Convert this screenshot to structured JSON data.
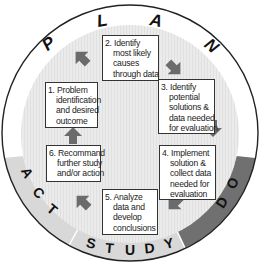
{
  "figure": {
    "type": "PDSA cycle diagram",
    "colors": {
      "outline": "#222222",
      "plan_segment": "#ffffff",
      "do_segment": "#6e6e6e",
      "study_segment": "#d9d9d9",
      "act_segment": "#d9d9d9",
      "inner_disk": "#e9e9e9",
      "arrow": "#6b6b6b",
      "box_fill": "#ffffff",
      "box_border": "#333333"
    },
    "segments": [
      {
        "id": "plan",
        "letters": [
          "P",
          "L",
          "A",
          "N"
        ]
      },
      {
        "id": "do",
        "letters": [
          "D",
          "O"
        ]
      },
      {
        "id": "study",
        "letters": [
          "S",
          "T",
          "U",
          "D",
          "Y"
        ]
      },
      {
        "id": "act",
        "letters": [
          "A",
          "C",
          "T"
        ]
      }
    ],
    "steps": [
      {
        "number": "1.",
        "lines": [
          "Problem",
          "identification",
          "and desired",
          "outcome"
        ]
      },
      {
        "number": "2.",
        "lines": [
          "Identify",
          "most likely",
          "causes",
          "through data"
        ]
      },
      {
        "number": "3.",
        "lines": [
          "Identify",
          "potential",
          "solutions &",
          "data needed",
          "for evaluation"
        ]
      },
      {
        "number": "4.",
        "lines": [
          "Implement",
          "solution &",
          "collect data",
          "needed for",
          "evaluation"
        ]
      },
      {
        "number": "5.",
        "lines": [
          "Analyze",
          "data and",
          "develop",
          "conclusions"
        ]
      },
      {
        "number": "6.",
        "lines": [
          "Recommand",
          "further study",
          "and/or action"
        ]
      }
    ],
    "arrows": [
      {
        "from": "1",
        "to": "2",
        "direction": "up-right"
      },
      {
        "from": "2",
        "to": "3",
        "direction": "down-right"
      },
      {
        "from": "3",
        "to": "4",
        "direction": "down"
      },
      {
        "from": "4",
        "to": "5",
        "direction": "down-left"
      },
      {
        "from": "5",
        "to": "6",
        "direction": "up-left"
      },
      {
        "from": "6",
        "to": "1",
        "direction": "up"
      }
    ]
  }
}
